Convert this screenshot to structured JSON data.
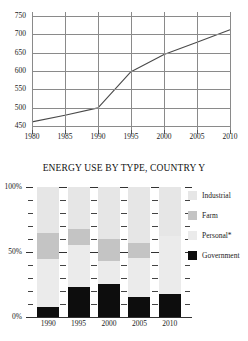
{
  "chart_data": [
    {
      "type": "line",
      "title": "",
      "xlabel": "",
      "ylabel": "",
      "grid": true,
      "legend": "none",
      "x": [
        1980,
        1985,
        1990,
        1995,
        2000,
        2005,
        2010
      ],
      "xticklabels": [
        "1980",
        "1985",
        "1990",
        "1995",
        "2000",
        "2005",
        "2010"
      ],
      "yticklabels": [
        "450",
        "500",
        "550",
        "600",
        "650",
        "700",
        "750"
      ],
      "ytickvalues": [
        450,
        500,
        550,
        600,
        650,
        700,
        750
      ],
      "xlim": [
        1980,
        2010
      ],
      "ylim": [
        440,
        760
      ],
      "series": [
        {
          "name": "total energy use",
          "values": [
            462,
            480,
            500,
            598,
            645,
            678,
            712
          ],
          "color": "#4a4a4a"
        }
      ]
    },
    {
      "type": "bar",
      "subtype": "stacked-100-percent",
      "title": "ENERGY USE BY TYPE, COUNTRY Y",
      "xlabel": "",
      "ylabel": "",
      "grid": false,
      "legend": "right",
      "categories": [
        "1990",
        "1995",
        "2000",
        "2005",
        "2010"
      ],
      "yticklabels": [
        "0%",
        "50%",
        "100%"
      ],
      "ytickvalues": [
        0,
        50,
        100
      ],
      "ylim": [
        0,
        100
      ],
      "minor_tick_step": 10,
      "series": [
        {
          "name": "Industrial",
          "color": "#e6e6e6",
          "values": [
            35,
            32,
            40,
            43,
            38
          ]
        },
        {
          "name": "Farm",
          "color": "#c4c4c4",
          "values": [
            20,
            13,
            17,
            12,
            0
          ]
        },
        {
          "name": "Personal*",
          "color": "#ebebeb",
          "values": [
            37,
            32,
            18,
            30,
            44
          ]
        },
        {
          "name": "Government",
          "color": "#0d0d0d",
          "values": [
            8,
            23,
            25,
            15,
            18
          ]
        }
      ],
      "stack_order_bottom_to_top": [
        "Government",
        "Personal*",
        "Farm",
        "Industrial"
      ]
    }
  ],
  "line_chart": {
    "name": "energy-total-line-chart"
  },
  "bar_chart": {
    "title": "ENERGY USE BY TYPE, COUNTRY Y"
  },
  "legend": {
    "items": [
      {
        "label": "Industrial",
        "color": "#e6e6e6"
      },
      {
        "label": "Farm",
        "color": "#c4c4c4"
      },
      {
        "label": "Personal*",
        "color": "#ebebeb"
      },
      {
        "label": "Government",
        "color": "#0d0d0d"
      }
    ]
  }
}
